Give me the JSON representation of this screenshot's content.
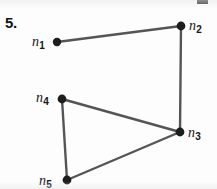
{
  "figure": {
    "problem_number": "5.",
    "background_color": "#fdfdfd",
    "ink_color": "#1d1d1d",
    "edge_color": "#555555",
    "width": 217,
    "height": 189,
    "graph_type": "undirected-node-link-diagram"
  },
  "nodes": [
    {
      "id": "n1",
      "label_base": "n",
      "label_sub": "1",
      "cx": 57,
      "cy": 42,
      "r": 4.2,
      "label_x": 32,
      "label_y": 35,
      "label_side": "left"
    },
    {
      "id": "n2",
      "label_base": "n",
      "label_sub": "2",
      "cx": 181,
      "cy": 26,
      "r": 4.4,
      "label_x": 189,
      "label_y": 19,
      "label_side": "right"
    },
    {
      "id": "n3",
      "label_base": "n",
      "label_sub": "3",
      "cx": 180,
      "cy": 132,
      "r": 4.4,
      "label_x": 188,
      "label_y": 126,
      "label_side": "right"
    },
    {
      "id": "n4",
      "label_base": "n",
      "label_sub": "4",
      "cx": 62,
      "cy": 99,
      "r": 4.4,
      "label_x": 36,
      "label_y": 91,
      "label_side": "left"
    },
    {
      "id": "n5",
      "label_base": "n",
      "label_sub": "5",
      "cx": 67,
      "cy": 180,
      "r": 4.4,
      "label_x": 39,
      "label_y": 174,
      "label_side": "left"
    }
  ],
  "edges": [
    {
      "id": "e-n1-n2",
      "from": "n1",
      "to": "n2",
      "x1": 57,
      "y1": 42,
      "x2": 181,
      "y2": 26
    },
    {
      "id": "e-n2-n3",
      "from": "n2",
      "to": "n3",
      "x1": 181,
      "y1": 26,
      "x2": 180,
      "y2": 132
    },
    {
      "id": "e-n4-n3",
      "from": "n4",
      "to": "n3",
      "x1": 62,
      "y1": 99,
      "x2": 180,
      "y2": 132
    },
    {
      "id": "e-n4-n5",
      "from": "n4",
      "to": "n5",
      "x1": 62,
      "y1": 99,
      "x2": 67,
      "y2": 180
    },
    {
      "id": "e-n5-n3",
      "from": "n5",
      "to": "n3",
      "x1": 67,
      "y1": 180,
      "x2": 180,
      "y2": 132
    }
  ],
  "problem_label": {
    "text": "5.",
    "x": 5,
    "y": 15
  },
  "artifacts": {
    "top_right_partial_mark": {
      "x": 197,
      "y": 0,
      "width": 11,
      "height": 4
    }
  }
}
